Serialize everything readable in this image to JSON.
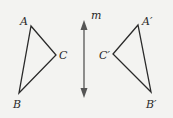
{
  "diagram": {
    "line": {
      "label": "m",
      "x": 84,
      "y1": 20,
      "y2": 98,
      "color": "#555555"
    },
    "original": {
      "vertices": [
        {
          "label": "A",
          "x": 31,
          "y": 26,
          "lx": 20,
          "ly": 25
        },
        {
          "label": "C",
          "x": 56,
          "y": 55,
          "lx": 59,
          "ly": 59
        },
        {
          "label": "B",
          "x": 19,
          "y": 93,
          "lx": 13,
          "ly": 108
        }
      ]
    },
    "image": {
      "vertices": [
        {
          "label": "A′",
          "x": 138,
          "y": 25,
          "lx": 142,
          "ly": 25
        },
        {
          "label": "C′",
          "x": 113,
          "y": 54,
          "lx": 99,
          "ly": 59
        },
        {
          "label": "B′",
          "x": 151,
          "y": 92,
          "lx": 146,
          "ly": 108
        }
      ]
    },
    "stroke_color": "#2a2a2a",
    "background": "#f3f3f1"
  }
}
